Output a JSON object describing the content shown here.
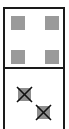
{
  "domino": {
    "top_half": {
      "value": 4,
      "pips": [
        {
          "x": 11,
          "y": 16,
          "crossed": false
        },
        {
          "x": 45,
          "y": 16,
          "crossed": false
        },
        {
          "x": 11,
          "y": 50,
          "crossed": false
        },
        {
          "x": 45,
          "y": 50,
          "crossed": false
        }
      ]
    },
    "bottom_half": {
      "value": 2,
      "pips": [
        {
          "x": 18,
          "y": 88,
          "crossed": true
        },
        {
          "x": 37,
          "y": 106,
          "crossed": true
        }
      ]
    },
    "colors": {
      "border": "#1a1a1a",
      "pip": "#9a9a9a",
      "cross": "#111111",
      "background": "#ffffff"
    }
  }
}
